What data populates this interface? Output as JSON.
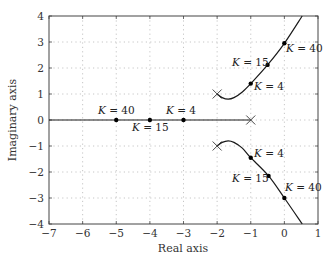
{
  "chart_data": {
    "type": "line",
    "title": "",
    "xlabel": "Real axis",
    "ylabel": "Imaginary axis",
    "xlim": [
      -7,
      1
    ],
    "ylim": [
      -4,
      4
    ],
    "grid": true,
    "x_ticks": [
      -7,
      -6,
      -5,
      -4,
      -3,
      -2,
      -1,
      0,
      1
    ],
    "y_ticks": [
      -4,
      -3,
      -2,
      -1,
      0,
      1,
      2,
      3,
      4
    ],
    "x_tick_labels": [
      "−7",
      "−6",
      "−5",
      "−4",
      "−3",
      "−2",
      "−1",
      "0",
      "1"
    ],
    "y_tick_labels": [
      "−4",
      "−3",
      "−2",
      "−1",
      "0",
      "1",
      "2",
      "3",
      "4"
    ],
    "poles": [
      [
        -1,
        0
      ],
      [
        -2,
        1
      ],
      [
        -2,
        -1
      ]
    ],
    "series": [
      {
        "name": "real-axis branch",
        "points": [
          [
            -7,
            0
          ],
          [
            -1,
            0
          ]
        ]
      },
      {
        "name": "upper complex branch",
        "points": [
          [
            -2,
            1
          ],
          [
            -1.85,
            0.86
          ],
          [
            -1.67,
            0.8
          ],
          [
            -1.5,
            0.86
          ],
          [
            -1.25,
            1.08
          ],
          [
            -1,
            1.4
          ],
          [
            -0.5,
            2.12
          ],
          [
            0,
            2.95
          ],
          [
            0.53,
            4
          ]
        ]
      },
      {
        "name": "lower complex branch",
        "points": [
          [
            -2,
            -1
          ],
          [
            -1.85,
            -0.86
          ],
          [
            -1.67,
            -0.8
          ],
          [
            -1.5,
            -0.86
          ],
          [
            -1.25,
            -1.08
          ],
          [
            -1,
            -1.45
          ],
          [
            -0.47,
            -2.15
          ],
          [
            0,
            -3.0
          ],
          [
            0.53,
            -4
          ]
        ]
      }
    ],
    "annotations": [
      {
        "text": "K = 40",
        "point": [
          -5,
          0
        ],
        "branch": "real"
      },
      {
        "text": "K = 15",
        "point": [
          -4,
          0
        ],
        "branch": "real"
      },
      {
        "text": "K = 4",
        "point": [
          -3,
          0
        ],
        "branch": "real"
      },
      {
        "text": "K = 4",
        "point": [
          -1,
          1.4
        ],
        "branch": "upper"
      },
      {
        "text": "K = 15",
        "point": [
          -0.5,
          2.12
        ],
        "branch": "upper"
      },
      {
        "text": "K = 40",
        "point": [
          0,
          2.95
        ],
        "branch": "upper"
      },
      {
        "text": "K = 4",
        "point": [
          -1,
          -1.45
        ],
        "branch": "lower"
      },
      {
        "text": "K = 15",
        "point": [
          -0.47,
          -2.15
        ],
        "branch": "lower"
      },
      {
        "text": "K = 40",
        "point": [
          0,
          -3.0
        ],
        "branch": "lower"
      }
    ]
  },
  "labels": {
    "k_symbol": "K",
    "k40": " = 40",
    "k15": " = 15",
    "k4": " = 4"
  }
}
